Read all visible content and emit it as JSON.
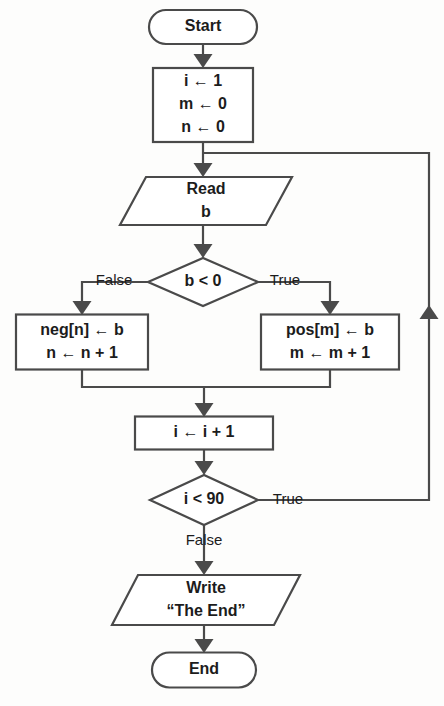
{
  "diagram": {
    "type": "flowchart",
    "colors": {
      "background": "#fdfdfc",
      "line": "#4a4a4a",
      "shape_fill": "#ffffff",
      "text": "#1c1c1c"
    },
    "nodes": [
      {
        "id": "start",
        "name": "start-terminal",
        "shape": "terminator",
        "lines": [
          "Start"
        ],
        "x": 203,
        "y": 27,
        "w": 108,
        "h": 34
      },
      {
        "id": "init",
        "name": "init-process",
        "shape": "process",
        "lines": [
          "i ← 1",
          "m ← 0",
          "n ← 0"
        ],
        "x": 203,
        "y": 105,
        "w": 100,
        "h": 74
      },
      {
        "id": "read_b",
        "name": "read-io",
        "shape": "parallelogram",
        "lines": [
          "Read",
          "b"
        ],
        "x": 206,
        "y": 201,
        "w": 172,
        "h": 48
      },
      {
        "id": "cond_b",
        "name": "decision-b-less-than-zero",
        "shape": "decision",
        "lines": [
          "b < 0"
        ],
        "x": 203,
        "y": 282,
        "w": 110,
        "h": 48
      },
      {
        "id": "neg",
        "name": "negative-branch-process",
        "shape": "process",
        "lines": [
          "neg[n] ← b",
          "n ← n + 1"
        ],
        "x": 82,
        "y": 342,
        "w": 132,
        "h": 55
      },
      {
        "id": "pos",
        "name": "positive-branch-process",
        "shape": "process",
        "lines": [
          "pos[m] ← b",
          "m ← m + 1"
        ],
        "x": 330,
        "y": 342,
        "w": 138,
        "h": 55
      },
      {
        "id": "incr",
        "name": "increment-process",
        "shape": "process",
        "lines": [
          "i ← i + 1"
        ],
        "x": 204,
        "y": 433,
        "w": 138,
        "h": 33
      },
      {
        "id": "cond_i",
        "name": "decision-i-less-than-90",
        "shape": "decision",
        "lines": [
          "i < 90"
        ],
        "x": 204,
        "y": 500,
        "w": 108,
        "h": 50
      },
      {
        "id": "write",
        "name": "write-io",
        "shape": "parallelogram",
        "lines": [
          "Write",
          "“The End”"
        ],
        "x": 206,
        "y": 600,
        "w": 188,
        "h": 50
      },
      {
        "id": "end",
        "name": "end-terminal",
        "shape": "terminator",
        "lines": [
          "End"
        ],
        "x": 204,
        "y": 670,
        "w": 104,
        "h": 35
      }
    ],
    "edge_labels": [
      {
        "id": "lbl_false_b",
        "name": "edge-label-false-b",
        "text": "False",
        "x": 114,
        "y": 281
      },
      {
        "id": "lbl_true_b",
        "name": "edge-label-true-b",
        "text": "True",
        "x": 285,
        "y": 281
      },
      {
        "id": "lbl_true_i",
        "name": "edge-label-true-i",
        "text": "True",
        "x": 288,
        "y": 500
      },
      {
        "id": "lbl_false_i",
        "name": "edge-label-false-i",
        "text": "False",
        "x": 204,
        "y": 541
      }
    ],
    "edges": [
      {
        "id": "e_start_init",
        "name": "edge-start-to-init",
        "path": "M 203 44 L 203 60",
        "arrow": "down",
        "arrow_x": 203,
        "arrow_y": 68
      },
      {
        "id": "e_init_read",
        "name": "edge-init-to-read",
        "path": "M 203 142 L 203 169",
        "arrow": "down",
        "arrow_x": 203,
        "arrow_y": 177
      },
      {
        "id": "e_read_cond",
        "name": "edge-read-to-decision",
        "path": "M 203 225 L 203 250",
        "arrow": "down",
        "arrow_x": 203,
        "arrow_y": 258
      },
      {
        "id": "e_cond_false",
        "name": "edge-decision-false-to-neg",
        "path": "M 148 282 L 138 282 L 82 282 L 82 307",
        "arrow": "down",
        "arrow_x": 82,
        "arrow_y": 315
      },
      {
        "id": "e_cond_true",
        "name": "edge-decision-true-to-pos",
        "path": "M 258 282 L 268 282 L 330 282 L 330 307",
        "arrow": "down",
        "arrow_x": 330,
        "arrow_y": 315
      },
      {
        "id": "e_neg_merge",
        "name": "edge-neg-to-merge",
        "path": "M 82 370 L 82 387 L 330 387 L 330 370",
        "arrow": "none",
        "arrow_x": 0,
        "arrow_y": 0
      },
      {
        "id": "e_merge_incr",
        "name": "edge-merge-to-increment",
        "path": "M 204 387 L 204 409",
        "arrow": "down",
        "arrow_x": 204,
        "arrow_y": 417
      },
      {
        "id": "e_incr_cond",
        "name": "edge-increment-to-decision",
        "path": "M 204 450 L 204 467",
        "arrow": "down",
        "arrow_x": 204,
        "arrow_y": 475
      },
      {
        "id": "e_loop_back",
        "name": "edge-loop-back-to-read",
        "path": "M 258 500 L 320 500 L 429 500 L 429 153 L 203 153",
        "arrow": "up",
        "arrow_x": 429,
        "arrow_y": 305
      },
      {
        "id": "e_cond_write",
        "name": "edge-decision-false-to-write",
        "path": "M 204 525 L 204 567",
        "arrow": "down",
        "arrow_x": 204,
        "arrow_y": 575
      },
      {
        "id": "e_write_end",
        "name": "edge-write-to-end",
        "path": "M 204 625 L 204 645",
        "arrow": "down",
        "arrow_x": 204,
        "arrow_y": 653
      }
    ]
  }
}
